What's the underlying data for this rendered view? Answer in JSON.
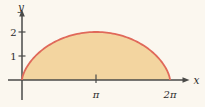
{
  "figure": {
    "background_color": "#fbf7ef",
    "axis_color": "#4a4a48",
    "text_color": "#2b2b2b",
    "x_axis_label": "x",
    "y_axis_label": "y"
  },
  "chart_data": {
    "type": "area",
    "title": "",
    "curve": "cycloid-arch",
    "parametric": {
      "x": "t - sin t",
      "y": "1 - cos t"
    },
    "t_range": [
      0,
      6.283185307
    ],
    "x_range": [
      0,
      6.283185307
    ],
    "y_range": [
      0,
      2
    ],
    "x_ticks": [
      {
        "value": 3.141592653,
        "label": "π"
      },
      {
        "value": 6.283185307,
        "label": "2π"
      }
    ],
    "y_ticks": [
      {
        "value": 1,
        "label": "1"
      },
      {
        "value": 2,
        "label": "2"
      }
    ],
    "key_points": [
      {
        "x": 0,
        "y": 0
      },
      {
        "x": 3.141592653,
        "y": 2
      },
      {
        "x": 6.283185307,
        "y": 0
      }
    ],
    "fill_color": "#f3d5a0",
    "stroke_color": "#e0695a",
    "grid": false,
    "legend_position": "none"
  }
}
